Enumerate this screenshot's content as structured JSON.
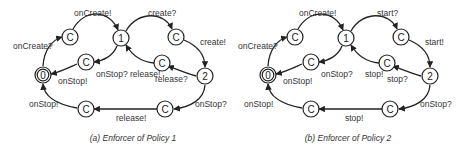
{
  "panels": [
    {
      "caption": "(a) Enforcer of Policy 1",
      "nodes": {
        "s0": "0",
        "c1": "C",
        "s1": "1",
        "c2": "C",
        "c3": "C",
        "c4": "C",
        "s2": "2",
        "c5": "C",
        "c6": "C"
      },
      "labels": {
        "on_create_q": "onCreate?",
        "on_create_x": "onCreate!",
        "on_stop_q_top": "onStop?",
        "on_stop_x_top": "onStop!",
        "top_right_q": "create?",
        "top_right_x": "create!",
        "mid_right_q": "release?",
        "mid_right_x": "release!",
        "on_stop_q_bottom": "onStop?",
        "bottom_x": "release!",
        "on_stop_x_bottom": "onStop!"
      }
    },
    {
      "caption": "(b) Enforcer of Policy 2",
      "nodes": {
        "s0": "0",
        "c1": "C",
        "s1": "1",
        "c2": "C",
        "c3": "C",
        "c4": "C",
        "s2": "2",
        "c5": "C",
        "c6": "C"
      },
      "labels": {
        "on_create_q": "onCreate?",
        "on_create_x": "onCreate!",
        "on_stop_q_top": "onStop?",
        "on_stop_x_top": "onStop!",
        "top_right_q": "start?",
        "top_right_x": "start!",
        "mid_right_q": "stop?",
        "mid_right_x": "stop!",
        "on_stop_q_bottom": "onStop?",
        "bottom_x": "stop!",
        "on_stop_x_bottom": "onStop!"
      }
    }
  ]
}
